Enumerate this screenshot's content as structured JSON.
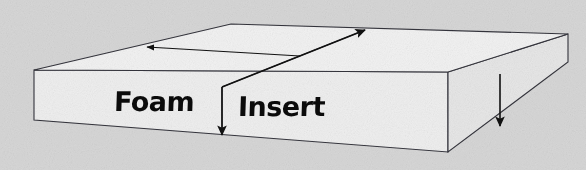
{
  "figure": {
    "kind": "isometric-slab-diagram",
    "subject": "Foam Insert",
    "labels": {
      "foam": "Foam",
      "insert": "Insert"
    },
    "annotations": [
      {
        "name": "length-arrow",
        "direction": "down-left",
        "along": "top-back-edge"
      },
      {
        "name": "width-arrow",
        "direction": "up-right",
        "along": "top-face-diagonal"
      },
      {
        "name": "thickness-arrow",
        "direction": "down",
        "along": "front-seam-edge"
      },
      {
        "name": "depth-arrow",
        "direction": "down",
        "along": "right-corner-edge"
      }
    ],
    "colors": {
      "background": "#d7d7d7",
      "top_face": "#f2f2f2",
      "front_face": "#eeeeee",
      "right_face": "#e6e6e6",
      "outline": "#33333a",
      "label_text": "#0b0b0b",
      "arrow": "#111111"
    },
    "geometry": {
      "top_left": [
        34,
        70
      ],
      "top_back": [
        231,
        24
      ],
      "top_right": [
        568,
        34
      ],
      "top_front_right": [
        448,
        72
      ],
      "front_left": [
        34,
        120
      ],
      "front_right": [
        448,
        152
      ],
      "seam_top": [
        222,
        87
      ],
      "right_bottom": [
        568,
        62
      ]
    },
    "canvas": {
      "width": 586,
      "height": 170
    }
  }
}
